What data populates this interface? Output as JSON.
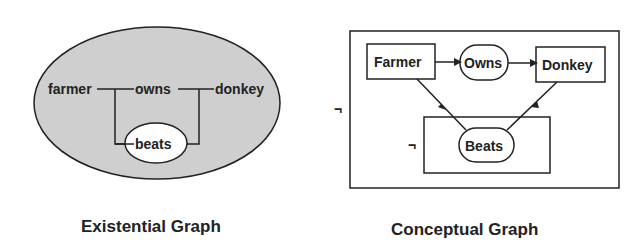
{
  "colors": {
    "ink": "#222222",
    "shade": "#cfcfcf",
    "background": "#ffffff"
  },
  "existential_graph": {
    "caption": "Existential Graph",
    "labels": {
      "farmer": "farmer",
      "owns": "owns",
      "donkey": "donkey",
      "beats": "beats"
    }
  },
  "conceptual_graph": {
    "caption": "Conceptual Graph",
    "concepts": {
      "farmer": "Farmer",
      "donkey": "Donkey"
    },
    "relations": {
      "owns": "Owns",
      "beats": "Beats"
    },
    "negation_outer": "¬",
    "negation_inner": "¬"
  }
}
